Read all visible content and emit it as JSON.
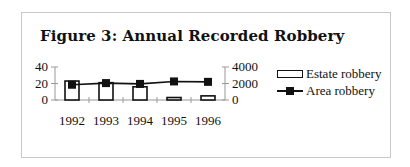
{
  "figure": {
    "title": "Figure 3: Annual Recorded Robbery"
  },
  "legend": {
    "items": [
      {
        "label": "Estate robbery",
        "type": "bar"
      },
      {
        "label": "Area robbery",
        "type": "line"
      }
    ]
  },
  "axes": {
    "left_ticks": [
      "40",
      "20",
      "0"
    ],
    "right_ticks": [
      "4000",
      "2000",
      "0"
    ],
    "x_ticks": [
      "1992",
      "1993",
      "1994",
      "1995",
      "1996"
    ]
  },
  "colors": {
    "ink": "#111111",
    "frame": "#c8c8c8",
    "bar_fill": "#ffffff"
  },
  "chart_data": {
    "type": "bar",
    "title": "Figure 3: Annual Recorded Robbery",
    "categories": [
      "1992",
      "1993",
      "1994",
      "1995",
      "1996"
    ],
    "series": [
      {
        "name": "Estate robbery",
        "type": "bar",
        "axis": "left",
        "values": [
          23,
          21,
          16,
          3,
          5
        ]
      },
      {
        "name": "Area robbery",
        "type": "line",
        "axis": "right",
        "values": [
          1850,
          2050,
          1950,
          2250,
          2200
        ]
      }
    ],
    "xlabel": "",
    "ylabel": "",
    "ylim": [
      0,
      40
    ],
    "y2lim": [
      0,
      4000
    ],
    "left_axis_ticks": [
      0,
      20,
      40
    ],
    "right_axis_ticks": [
      0,
      2000,
      4000
    ],
    "grid": false,
    "legend_position": "right"
  }
}
